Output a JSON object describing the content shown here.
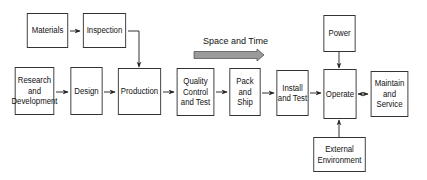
{
  "diagram": {
    "flow_label": "Space and Time",
    "nodes": [
      {
        "id": "materials",
        "label": "Materials"
      },
      {
        "id": "inspection",
        "label": "Inspection"
      },
      {
        "id": "research",
        "label": "Research\nand\nDevelopment"
      },
      {
        "id": "design",
        "label": "Design"
      },
      {
        "id": "production",
        "label": "Production"
      },
      {
        "id": "quality",
        "label": "Quality\nControl\nand Test"
      },
      {
        "id": "pack",
        "label": "Pack\nand\nShip"
      },
      {
        "id": "install",
        "label": "Install\nand Test"
      },
      {
        "id": "operate",
        "label": "Operate"
      },
      {
        "id": "maintain",
        "label": "Maintain\nand\nService"
      },
      {
        "id": "power",
        "label": "Power"
      },
      {
        "id": "environment",
        "label": "External\nEnvironment"
      }
    ],
    "edges": [
      {
        "from": "materials",
        "to": "inspection"
      },
      {
        "from": "inspection",
        "to": "production"
      },
      {
        "from": "research",
        "to": "design"
      },
      {
        "from": "design",
        "to": "production"
      },
      {
        "from": "production",
        "to": "quality"
      },
      {
        "from": "quality",
        "to": "pack"
      },
      {
        "from": "pack",
        "to": "install"
      },
      {
        "from": "install",
        "to": "operate"
      },
      {
        "from": "operate",
        "to": "maintain",
        "bidirectional": true
      },
      {
        "from": "power",
        "to": "operate"
      },
      {
        "from": "environment",
        "to": "operate"
      }
    ],
    "colors": {
      "line": "#333333",
      "flow_arrow_fill": "#9a9a9a",
      "flow_arrow_stroke": "#555555"
    }
  }
}
